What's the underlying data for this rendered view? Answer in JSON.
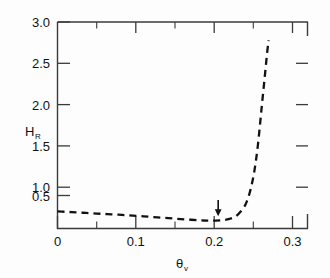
{
  "chart_data": {
    "type": "line",
    "title": "",
    "subtitle": "",
    "xlabel": "θ",
    "xlabel_sub": "v",
    "ylabel": "H",
    "ylabel_sub": "R",
    "xlim": [
      0,
      0.35
    ],
    "ylim": [
      0.4,
      3.0
    ],
    "grid": false,
    "legend": null,
    "linestyle": "dashed",
    "x_ticks": [
      0,
      0.05,
      0.1,
      0.15,
      0.2,
      0.25,
      0.3,
      0.35
    ],
    "x_tick_labels": [
      "0",
      "",
      "0.1",
      "",
      "0.2",
      "",
      "0.3",
      ""
    ],
    "x_major_labels": [
      "0",
      "0.1",
      "0.2",
      "0.3"
    ],
    "y_ticks": [
      0.5,
      1.0,
      1.5,
      2.0,
      2.5,
      3.0
    ],
    "y_tick_labels": [
      "0.5",
      "1.0",
      "1.5",
      "2.0",
      "2.5",
      "3.0"
    ],
    "series": [
      {
        "name": "H_R",
        "x": [
          0.0,
          0.01,
          0.02,
          0.03,
          0.04,
          0.05,
          0.06,
          0.07,
          0.08,
          0.09,
          0.1,
          0.12,
          0.14,
          0.16,
          0.18,
          0.2,
          0.21,
          0.22,
          0.23,
          0.24,
          0.25,
          0.26,
          0.265,
          0.27,
          0.275,
          0.28,
          0.285,
          0.29,
          0.293,
          0.295
        ],
        "y": [
          0.615,
          0.611,
          0.606,
          0.601,
          0.596,
          0.591,
          0.586,
          0.581,
          0.576,
          0.571,
          0.566,
          0.553,
          0.54,
          0.527,
          0.514,
          0.503,
          0.5,
          0.5,
          0.505,
          0.52,
          0.56,
          0.66,
          0.75,
          0.9,
          1.12,
          1.45,
          1.9,
          2.35,
          2.62,
          2.77
        ]
      }
    ],
    "annotations": [
      {
        "type": "arrow",
        "label": "",
        "x": 0.2245,
        "y_tip": 0.555,
        "y_tail": 0.76,
        "direction": "down"
      }
    ]
  }
}
